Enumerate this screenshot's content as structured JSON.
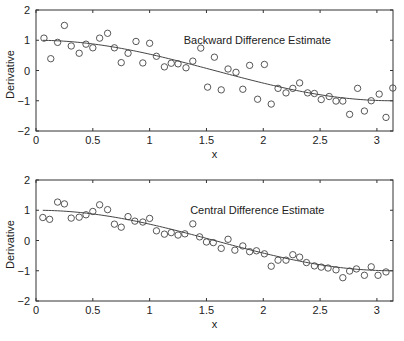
{
  "chart_data": [
    {
      "type": "scatter",
      "title": "Backward Difference Estimate",
      "xlabel": "x",
      "ylabel": "Derivative",
      "xlim": [
        0,
        3.1416
      ],
      "ylim": [
        -2,
        2
      ],
      "xticks": [
        0,
        0.5,
        1,
        1.5,
        2,
        2.5,
        3
      ],
      "xtick_labels": [
        "0",
        "0.5",
        "1",
        "1.5",
        "2",
        "2.5",
        "3"
      ],
      "yticks": [
        -2,
        -1,
        0,
        1,
        2
      ],
      "ytick_labels": [
        "−2",
        "−1",
        "0",
        "1",
        "2"
      ],
      "grid": false,
      "annotation_position": [
        0.62,
        0.82
      ],
      "series": [
        {
          "name": "estimate",
          "style": "open-circle",
          "x": [
            0.07,
            0.13,
            0.19,
            0.25,
            0.31,
            0.38,
            0.44,
            0.5,
            0.56,
            0.63,
            0.69,
            0.75,
            0.81,
            0.88,
            0.94,
            1.0,
            1.06,
            1.13,
            1.19,
            1.25,
            1.32,
            1.38,
            1.45,
            1.51,
            1.57,
            1.63,
            1.69,
            1.76,
            1.82,
            1.88,
            1.95,
            2.01,
            2.07,
            2.13,
            2.2,
            2.26,
            2.32,
            2.39,
            2.45,
            2.51,
            2.58,
            2.64,
            2.7,
            2.76,
            2.83,
            2.89,
            2.95,
            3.02,
            3.08,
            3.14
          ],
          "y": [
            1.07,
            0.39,
            0.93,
            1.49,
            0.81,
            0.57,
            0.87,
            0.75,
            1.07,
            1.23,
            0.75,
            0.26,
            0.57,
            0.96,
            0.25,
            0.9,
            0.47,
            0.12,
            0.24,
            0.22,
            0.09,
            0.31,
            0.74,
            -0.55,
            0.44,
            -0.64,
            0.05,
            -0.06,
            -0.62,
            0.17,
            -0.95,
            0.2,
            -1.11,
            -0.59,
            -0.74,
            -0.59,
            -0.41,
            -0.74,
            -0.76,
            -0.96,
            -0.86,
            -1.01,
            -1.01,
            -1.45,
            -0.59,
            -1.34,
            -1.0,
            -0.78,
            -1.55,
            -0.58
          ]
        },
        {
          "name": "true derivative cos(x)",
          "style": "line",
          "function": "cos"
        }
      ]
    },
    {
      "type": "scatter",
      "title": "Central Difference Estimate",
      "xlabel": "x",
      "ylabel": "Derivative",
      "xlim": [
        0,
        3.1416
      ],
      "ylim": [
        -2,
        2
      ],
      "xticks": [
        0,
        0.5,
        1,
        1.5,
        2,
        2.5,
        3
      ],
      "xtick_labels": [
        "0",
        "0.5",
        "1",
        "1.5",
        "2",
        "2.5",
        "3"
      ],
      "yticks": [
        -2,
        -1,
        0,
        1,
        2
      ],
      "ytick_labels": [
        "−2",
        "−1",
        "0",
        "1",
        "2"
      ],
      "grid": false,
      "annotation_position": [
        0.62,
        0.82
      ],
      "series": [
        {
          "name": "estimate",
          "style": "open-circle",
          "x": [
            0.06,
            0.12,
            0.19,
            0.25,
            0.31,
            0.38,
            0.44,
            0.5,
            0.56,
            0.63,
            0.69,
            0.75,
            0.81,
            0.87,
            0.94,
            1.0,
            1.06,
            1.13,
            1.19,
            1.25,
            1.31,
            1.38,
            1.44,
            1.5,
            1.56,
            1.63,
            1.69,
            1.75,
            1.82,
            1.88,
            1.94,
            2.01,
            2.07,
            2.13,
            2.2,
            2.26,
            2.32,
            2.38,
            2.45,
            2.51,
            2.57,
            2.64,
            2.7,
            2.76,
            2.82,
            2.89,
            2.95,
            3.01,
            3.08
          ],
          "y": [
            0.76,
            0.7,
            1.27,
            1.21,
            0.74,
            0.77,
            0.85,
            0.96,
            1.18,
            1.02,
            0.54,
            0.44,
            0.79,
            0.64,
            0.61,
            0.73,
            0.32,
            0.21,
            0.26,
            0.18,
            0.22,
            0.55,
            0.12,
            -0.05,
            -0.07,
            -0.26,
            0.04,
            -0.32,
            -0.18,
            -0.37,
            -0.34,
            -0.44,
            -0.85,
            -0.65,
            -0.65,
            -0.47,
            -0.55,
            -0.73,
            -0.84,
            -0.88,
            -0.91,
            -0.97,
            -1.23,
            -1.01,
            -0.94,
            -1.15,
            -0.87,
            -1.15,
            -1.04
          ]
        },
        {
          "name": "true derivative cos(x)",
          "style": "line",
          "function": "cos"
        }
      ]
    }
  ],
  "layout": {
    "panels": [
      {
        "left": 36,
        "top": 10,
        "right": 393,
        "bottom": 131
      },
      {
        "left": 36,
        "top": 180,
        "right": 393,
        "bottom": 301
      }
    ],
    "colors": {
      "axis": "#333333",
      "marker": "#444444",
      "line": "#444444",
      "text": "#222222"
    }
  }
}
